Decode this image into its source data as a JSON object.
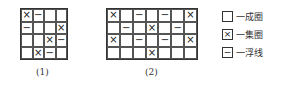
{
  "symbols": {
    "X": "×",
    "-": "−",
    "": ""
  },
  "diagrams": [
    {
      "caption": "(1)",
      "cols": 4,
      "rows": 4,
      "cells": [
        [
          "X",
          "-",
          "",
          ""
        ],
        [
          "-",
          "",
          "",
          "X"
        ],
        [
          "",
          "",
          "X",
          "-"
        ],
        [
          "",
          "X",
          "-",
          ""
        ]
      ]
    },
    {
      "caption": "(2)",
      "cols": 7,
      "rows": 4,
      "cells": [
        [
          "X",
          "",
          "-",
          "",
          "-",
          "",
          "X"
        ],
        [
          "",
          "-",
          "",
          "X",
          "",
          "-",
          ""
        ],
        [
          "X",
          "",
          "-",
          "",
          "-",
          "",
          "X"
        ],
        [
          "",
          "",
          "",
          "X",
          "",
          "",
          ""
        ]
      ]
    }
  ],
  "legend": [
    {
      "symbol": "",
      "label": "一成圈",
      "icon": "empty-square-icon"
    },
    {
      "symbol": "×",
      "label": "一集圈",
      "icon": "cross-square-icon"
    },
    {
      "symbol": "−",
      "label": "一浮线",
      "icon": "dash-square-icon"
    }
  ]
}
